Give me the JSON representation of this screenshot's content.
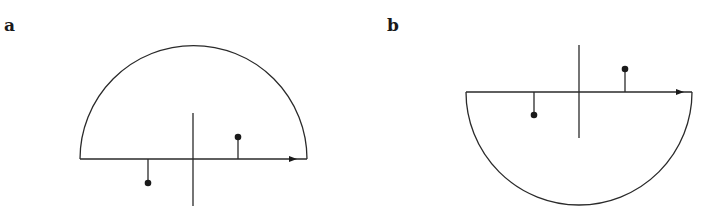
{
  "panels": [
    {
      "label": "a",
      "shape": "semicircle-above-axis",
      "label_pos": [
        4,
        31
      ],
      "baseline": {
        "y": 159,
        "x1": 80,
        "x2": 307
      },
      "arc": {
        "cx": 193.5,
        "r": 113.5,
        "sweep": "up"
      },
      "vertical_axis": {
        "x": 193,
        "y1": 113,
        "y2": 206
      },
      "arrow_x": 297,
      "charges": [
        {
          "x": 148,
          "y_base": 159,
          "y_tip": 183,
          "side": "below"
        },
        {
          "x": 238,
          "y_base": 159,
          "y_tip": 137,
          "side": "above"
        }
      ]
    },
    {
      "label": "b",
      "shape": "semicircle-below-axis",
      "label_pos": [
        387,
        31
      ],
      "baseline": {
        "y": 92,
        "x1": 466,
        "x2": 692
      },
      "arc": {
        "cx": 579,
        "r": 113,
        "sweep": "down"
      },
      "vertical_axis": {
        "x": 579,
        "y1": 45,
        "y2": 138
      },
      "arrow_x": 684,
      "charges": [
        {
          "x": 534,
          "y_base": 92,
          "y_tip": 115,
          "side": "below"
        },
        {
          "x": 625,
          "y_base": 92,
          "y_tip": 69,
          "side": "above"
        }
      ]
    }
  ]
}
